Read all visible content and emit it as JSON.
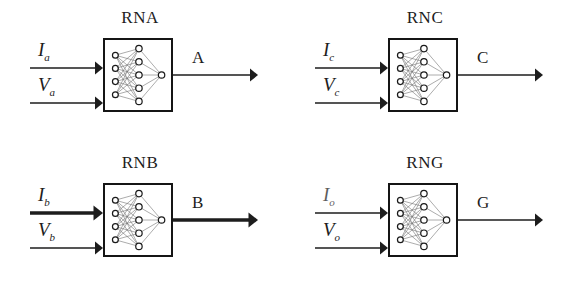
{
  "figure": {
    "background_color": "#ffffff",
    "ink_color": "#1d1d1d",
    "width": 570,
    "height": 289
  },
  "network": {
    "input_nodes": 4,
    "hidden_nodes": 5,
    "output_nodes": 1,
    "node_fill": "#ffffff",
    "node_stroke": "#1a1a1a",
    "edge_color": "#6b6b6b"
  },
  "blocks": [
    {
      "id": "rna",
      "title": "RNA",
      "position": {
        "left": 0,
        "top": 0
      },
      "inputs": [
        {
          "name": "current-input",
          "symbol": "I",
          "subscript": "a",
          "bold": false
        },
        {
          "name": "voltage-input",
          "symbol": "V",
          "subscript": "a",
          "bold": false
        }
      ],
      "output": {
        "name": "output-a",
        "label": "A",
        "bold": false
      }
    },
    {
      "id": "rnc",
      "title": "RNC",
      "position": {
        "left": 285,
        "top": 0
      },
      "inputs": [
        {
          "name": "current-input",
          "symbol": "I",
          "subscript": "c",
          "bold": false
        },
        {
          "name": "voltage-input",
          "symbol": "V",
          "subscript": "c",
          "bold": false
        }
      ],
      "output": {
        "name": "output-c",
        "label": "C",
        "bold": false
      }
    },
    {
      "id": "rnb",
      "title": "RNB",
      "position": {
        "left": 0,
        "top": 145
      },
      "inputs": [
        {
          "name": "current-input",
          "symbol": "I",
          "subscript": "b",
          "bold": true
        },
        {
          "name": "voltage-input",
          "symbol": "V",
          "subscript": "b",
          "bold": false
        }
      ],
      "output": {
        "name": "output-b",
        "label": "B",
        "bold": true
      }
    },
    {
      "id": "rng",
      "title": "RNG",
      "position": {
        "left": 285,
        "top": 145
      },
      "inputs": [
        {
          "name": "current-input",
          "symbol": "I",
          "subscript": "o",
          "bold": false,
          "degraded": true
        },
        {
          "name": "voltage-input",
          "symbol": "V",
          "subscript": "o",
          "bold": false
        }
      ],
      "output": {
        "name": "output-g",
        "label": "G",
        "bold": false
      }
    }
  ]
}
